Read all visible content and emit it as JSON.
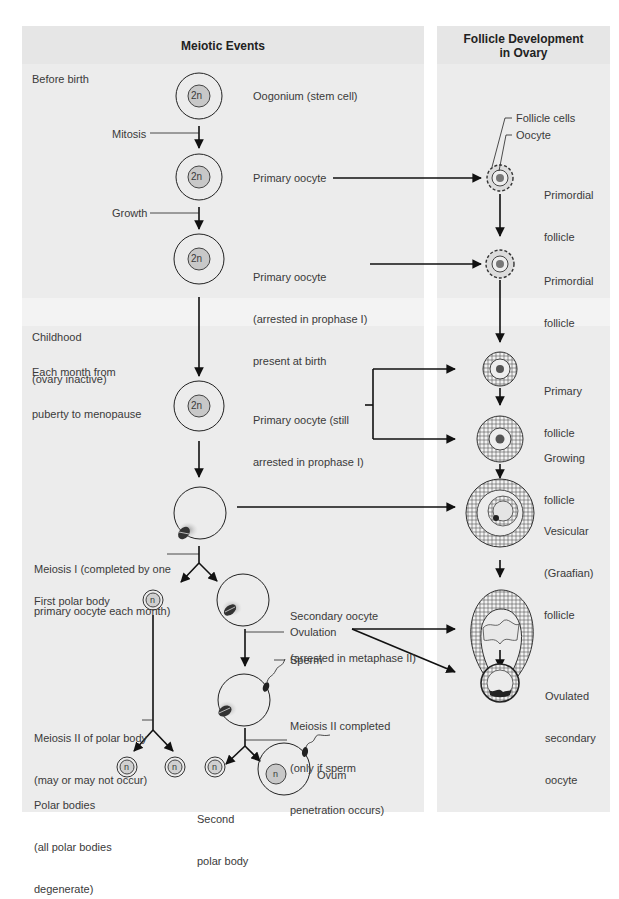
{
  "headers": {
    "meiotic": "Meiotic Events",
    "follicle_line1": "Follicle Development",
    "follicle_line2": "in Ovary"
  },
  "stages": {
    "before_birth": "Before birth",
    "childhood_line1": "Childhood",
    "childhood_line2": "(ovary inactive)",
    "monthly_line1": "Each month from",
    "monthly_line2": "puberty to menopause"
  },
  "cells": {
    "oogonium": {
      "ploidy": "2n",
      "label": "Oogonium (stem cell)"
    },
    "primary_oocyte": {
      "ploidy": "2n",
      "label": "Primary oocyte"
    },
    "primary_oocyte_arrested": {
      "ploidy": "2n",
      "line1": "Primary oocyte",
      "line2": "(arrested in prophase I)",
      "line3": "present at birth"
    },
    "primary_oocyte_still": {
      "ploidy": "2n",
      "line1": "Primary oocyte (still",
      "line2": "arrested in prophase I)"
    },
    "secondary_oocyte": {
      "line1": "Secondary oocyte",
      "line2": "(arrested in metaphase II)"
    },
    "first_polar_body": {
      "ploidy": "n",
      "label": "First polar body"
    },
    "polar_bodies": {
      "ploidy": "n",
      "line1": "Polar bodies",
      "line2": "(all polar bodies",
      "line3": "degenerate)"
    },
    "second_polar_body": {
      "ploidy": "n",
      "line1": "Second",
      "line2": "polar body"
    },
    "ovum": {
      "ploidy": "n",
      "label": "Ovum"
    }
  },
  "processes": {
    "mitosis": "Mitosis",
    "growth": "Growth",
    "meiosis1_line1": "Meiosis I (completed by one",
    "meiosis1_line2": "primary oocyte each month)",
    "ovulation": "Ovulation",
    "sperm": "Sperm",
    "meiosis2_line1": "Meiosis II completed",
    "meiosis2_line2": "(only if sperm",
    "meiosis2_line3": "penetration occurs)",
    "meiosis2_polar_line1": "Meiosis II of polar body",
    "meiosis2_polar_line2": "(may or may not occur)"
  },
  "follicles": {
    "callout_follicle_cells": "Follicle cells",
    "callout_oocyte": "Oocyte",
    "primordial1_line1": "Primordial",
    "primordial1_line2": "follicle",
    "primordial2_line1": "Primordial",
    "primordial2_line2": "follicle",
    "primary_line1": "Primary",
    "primary_line2": "follicle",
    "growing_line1": "Growing",
    "growing_line2": "follicle",
    "vesicular_line1": "Vesicular",
    "vesicular_line2": "(Graafian)",
    "vesicular_line3": "follicle",
    "ovulated_line1": "Ovulated",
    "ovulated_line2": "secondary",
    "ovulated_line3": "oocyte"
  },
  "colors": {
    "panel_bg": "#ececec",
    "nucleus_fill": "#c8c8c8",
    "line": "#111111"
  }
}
